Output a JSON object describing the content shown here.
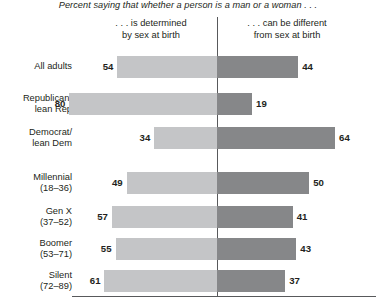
{
  "chart_data": {
    "type": "bar",
    "subtype": "diverging-stacked-bar",
    "title": "Percent saying that whether a person is a man or a woman . . .",
    "xlabel": "",
    "ylabel": "",
    "grid": false,
    "legend_position": "top",
    "xlim": [
      0,
      100
    ],
    "categories": [
      "All adults",
      "Republican/ lean Rep",
      "Democrat/ lean Dem",
      "Millennial (18–36)",
      "Gen X (37–52)",
      "Boomer (53–71)",
      "Silent (72–89)"
    ],
    "series": [
      {
        "name": ". . . is determined by sex at birth",
        "direction": "left",
        "color": "#c4c5c7",
        "values": [
          54,
          80,
          34,
          49,
          57,
          55,
          61
        ]
      },
      {
        "name": ". . . can be different from sex at birth",
        "direction": "right",
        "color": "#868789",
        "values": [
          44,
          19,
          64,
          50,
          41,
          43,
          37
        ]
      }
    ]
  },
  "header": {
    "title": "Percent saying that whether a person is a man or a woman . . .",
    "left_column": {
      "line1": ". . . is determined",
      "line2": "by sex at birth"
    },
    "right_column": {
      "line1": ". . . can be different",
      "line2": "from sex at birth"
    }
  },
  "rows": [
    {
      "label_lines": [
        "All adults"
      ],
      "left_value": "54",
      "right_value": "44",
      "top": 56,
      "height": 22
    },
    {
      "label_lines": [
        "Republican/",
        "lean Rep"
      ],
      "left_value": "80",
      "right_value": "19",
      "top": 93,
      "height": 22
    },
    {
      "label_lines": [
        "Democrat/",
        "lean Dem"
      ],
      "left_value": "34",
      "right_value": "64",
      "top": 127,
      "height": 22
    },
    {
      "label_lines": [
        "Millennial",
        "(18–36)"
      ],
      "left_value": "49",
      "right_value": "50",
      "top": 172,
      "height": 22
    },
    {
      "label_lines": [
        "Gen X",
        "(37–52)"
      ],
      "left_value": "57",
      "right_value": "41",
      "top": 206,
      "height": 22
    },
    {
      "label_lines": [
        "Boomer",
        "(53–71)"
      ],
      "left_value": "55",
      "right_value": "43",
      "top": 238,
      "height": 22
    },
    {
      "label_lines": [
        "Silent",
        "(72–89)"
      ],
      "left_value": "61",
      "right_value": "37",
      "top": 270,
      "height": 22
    }
  ],
  "colors": {
    "bar_left": "#c4c5c7",
    "bar_right": "#868789",
    "axis": "#58595b",
    "text": "#231f20",
    "background": "#ffffff"
  },
  "layout": {
    "axis_x": 217,
    "px_per_unit": 1.845
  }
}
